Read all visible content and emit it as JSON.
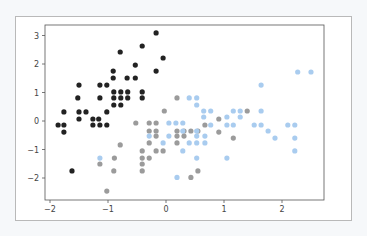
{
  "chart_data": {
    "type": "scatter",
    "title": "",
    "xlabel": "",
    "ylabel": "",
    "xlim": [
      -2.1,
      2.74
    ],
    "ylim": [
      -2.75,
      3.4
    ],
    "x_ticks": [
      "−2",
      "−1",
      "0",
      "1",
      "2"
    ],
    "x_tick_values": [
      -2,
      -1,
      0,
      1,
      2
    ],
    "y_ticks": [
      "3",
      "2",
      "1",
      "0",
      "−1",
      "−2"
    ],
    "y_tick_values": [
      3,
      2,
      1,
      0,
      -1,
      -2
    ],
    "grid": false,
    "legend": null,
    "series": [
      {
        "name": "cluster-black",
        "color": "#222222",
        "points": [
          [
            -0.17,
            3.09
          ],
          [
            -0.41,
            2.63
          ],
          [
            -0.79,
            2.42
          ],
          [
            -0.05,
            2.21
          ],
          [
            -0.53,
            1.96
          ],
          [
            -0.17,
            1.75
          ],
          [
            -0.91,
            1.75
          ],
          [
            -0.91,
            1.51
          ],
          [
            -0.67,
            1.51
          ],
          [
            -0.53,
            1.51
          ],
          [
            -1.5,
            1.26
          ],
          [
            -1.14,
            1.26
          ],
          [
            -1.02,
            1.26
          ],
          [
            -0.9,
            1.02
          ],
          [
            -0.78,
            1.02
          ],
          [
            -0.66,
            1.02
          ],
          [
            -0.41,
            1.02
          ],
          [
            -1.52,
            0.81
          ],
          [
            -1.14,
            0.81
          ],
          [
            -0.9,
            0.81
          ],
          [
            -0.78,
            0.81
          ],
          [
            -0.66,
            0.81
          ],
          [
            -0.41,
            0.81
          ],
          [
            -0.9,
            0.56
          ],
          [
            -0.78,
            0.56
          ],
          [
            -1.76,
            0.32
          ],
          [
            -1.5,
            0.32
          ],
          [
            -1.38,
            0.32
          ],
          [
            -1.02,
            0.32
          ],
          [
            -1.5,
            0.07
          ],
          [
            -1.26,
            0.07
          ],
          [
            -1.16,
            0.07
          ],
          [
            -1.86,
            -0.14
          ],
          [
            -1.76,
            -0.14
          ],
          [
            -1.26,
            -0.14
          ],
          [
            -1.14,
            -0.14
          ],
          [
            -1.02,
            -0.14
          ],
          [
            -1.76,
            -0.39
          ],
          [
            -1.62,
            -1.75
          ]
        ]
      },
      {
        "name": "cluster-gray",
        "color": "#9b9b9b",
        "points": [
          [
            0.19,
            0.81
          ],
          [
            -0.03,
            0.35
          ],
          [
            -0.52,
            -0.07
          ],
          [
            -0.29,
            -0.07
          ],
          [
            -0.17,
            -0.07
          ],
          [
            -0.29,
            -0.35
          ],
          [
            -0.17,
            -0.35
          ],
          [
            0.19,
            -0.35
          ],
          [
            0.31,
            -0.35
          ],
          [
            0.43,
            -0.35
          ],
          [
            0.55,
            -0.35
          ],
          [
            -0.17,
            -0.53
          ],
          [
            0.19,
            -0.53
          ],
          [
            0.31,
            -0.53
          ],
          [
            -0.29,
            -0.77
          ],
          [
            0.19,
            -0.77
          ],
          [
            -0.41,
            -1.05
          ],
          [
            -0.17,
            -1.05
          ],
          [
            -0.05,
            -1.05
          ],
          [
            -0.41,
            -1.3
          ],
          [
            -0.29,
            -1.3
          ],
          [
            -0.41,
            -1.51
          ],
          [
            -0.41,
            -1.75
          ],
          [
            -0.79,
            -0.84
          ],
          [
            -0.89,
            -1.3
          ],
          [
            -1.14,
            -1.51
          ],
          [
            -0.9,
            -1.75
          ],
          [
            -1.02,
            -2.46
          ],
          [
            0.55,
            -1.75
          ],
          [
            0.43,
            -1.98
          ],
          [
            1.4,
            0.35
          ],
          [
            0.91,
            0.07
          ],
          [
            0.67,
            -0.14
          ],
          [
            0.91,
            -0.39
          ],
          [
            1.16,
            -0.6
          ]
        ]
      },
      {
        "name": "cluster-lightblue",
        "color": "#a9ccef",
        "points": [
          [
            0.4,
            0.81
          ],
          [
            0.53,
            0.81
          ],
          [
            0.53,
            0.56
          ],
          [
            0.65,
            0.35
          ],
          [
            0.77,
            0.35
          ],
          [
            1.16,
            0.35
          ],
          [
            1.28,
            0.35
          ],
          [
            1.64,
            0.35
          ],
          [
            0.65,
            0.14
          ],
          [
            1.05,
            0.14
          ],
          [
            1.28,
            0.14
          ],
          [
            0.77,
            -0.14
          ],
          [
            1.05,
            -0.14
          ],
          [
            1.16,
            -0.14
          ],
          [
            1.52,
            -0.14
          ],
          [
            1.64,
            -0.14
          ],
          [
            2.1,
            -0.14
          ],
          [
            2.22,
            -0.14
          ],
          [
            0.05,
            -0.07
          ],
          [
            0.17,
            -0.07
          ],
          [
            0.29,
            -0.07
          ],
          [
            0.29,
            -0.35
          ],
          [
            0.53,
            -0.35
          ],
          [
            1.76,
            -0.35
          ],
          [
            -0.29,
            -0.53
          ],
          [
            0.05,
            -0.53
          ],
          [
            0.53,
            -0.53
          ],
          [
            0.67,
            -0.53
          ],
          [
            1.88,
            -0.6
          ],
          [
            2.22,
            -0.6
          ],
          [
            0.4,
            -0.77
          ],
          [
            0.53,
            -0.77
          ],
          [
            0.67,
            -0.77
          ],
          [
            -0.05,
            -0.77
          ],
          [
            0.29,
            -1.05
          ],
          [
            2.22,
            -1.05
          ],
          [
            0.53,
            -1.3
          ],
          [
            1.05,
            -1.3
          ],
          [
            -1.14,
            -1.3
          ],
          [
            0.19,
            -1.98
          ],
          [
            2.27,
            1.72
          ],
          [
            2.5,
            1.72
          ],
          [
            1.64,
            1.26
          ]
        ]
      }
    ]
  }
}
